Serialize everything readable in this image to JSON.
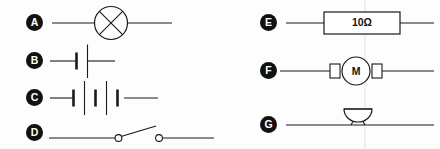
{
  "diagram": {
    "type": "electrical-circuit-symbols",
    "stroke_color": "#1a1a1a",
    "label_background": "#111111",
    "label_text_color": "#ffffff",
    "background": "#fdfdfd"
  },
  "columns": [
    {
      "name": "left-column",
      "rows": [
        {
          "label": "A",
          "symbol": "lamp-icon",
          "symbol_name": "lamp",
          "description": "circle with diagonal cross on a horizontal wire",
          "value": ""
        },
        {
          "label": "B",
          "symbol": "cell-icon",
          "symbol_name": "cell",
          "description": "single cell: one short thick plate and one long thin plate",
          "value": ""
        },
        {
          "label": "C",
          "symbol": "battery-icon",
          "symbol_name": "battery",
          "description": "battery of three cells in series",
          "value": ""
        },
        {
          "label": "D",
          "symbol": "open-switch-icon",
          "symbol_name": "open switch",
          "description": "two contact circles with a raised lever",
          "value": ""
        }
      ]
    },
    {
      "name": "right-column",
      "rows": [
        {
          "label": "E",
          "symbol": "resistor-icon",
          "symbol_name": "resistor",
          "description": "rectangle on a wire labelled with its resistance",
          "value": "10Ω"
        },
        {
          "label": "F",
          "symbol": "motor-icon",
          "symbol_name": "motor",
          "description": "circle marked M with terminal boxes either side",
          "value": "M"
        },
        {
          "label": "G",
          "symbol": "bell-icon",
          "symbol_name": "bell",
          "description": "dome on a short stem sitting on the wire",
          "value": ""
        }
      ]
    }
  ]
}
